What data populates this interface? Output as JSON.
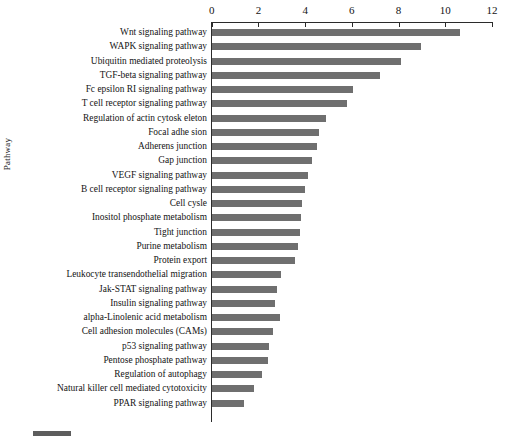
{
  "chart_data": {
    "type": "bar",
    "orientation": "horizontal",
    "title": "",
    "xlabel": "",
    "ylabel": "Pathway",
    "xlim": [
      0,
      12
    ],
    "xticks": [
      0,
      2,
      4,
      6,
      8,
      10,
      12
    ],
    "grid": false,
    "legend": "",
    "bar_color": "#6f6f6f",
    "categories": [
      "Wnt signaling pathway",
      "WAPK signaling pathway",
      "Ubiquitin mediated proteolysis",
      "TGF-beta signaling pathway",
      "Fc epsilon RI signaling pathway",
      "T cell receptor signaling pathway",
      "Regulation of actin cytosk eleton",
      "Focal adhe sion",
      "Adherens junction",
      "Gap junction",
      "VEGF signaling pathway",
      "B cell receptor signaling pathway",
      "Cell cysle",
      "Inositol phosphate metabolism",
      "Tight junction",
      "Purine metabolism",
      "Protein export",
      "Leukocyte transendothelial migration",
      "Jak-STAT signaling pathway",
      "Insulin signaling pathway",
      "alpha-Linolenic acid metabolism",
      "Cell adhesion molecules (CAMs)",
      "p53 signaling pathway",
      "Pentose phosphate pathway",
      "Regulation of autophagy",
      "Natural killer cell mediated cytotoxicity",
      "PPAR signaling pathway"
    ],
    "values": [
      10.6,
      8.95,
      8.1,
      7.2,
      6.05,
      5.8,
      4.9,
      4.6,
      4.5,
      4.3,
      4.1,
      4.0,
      3.85,
      3.8,
      3.75,
      3.7,
      3.55,
      2.95,
      2.8,
      2.7,
      2.9,
      2.6,
      2.45,
      2.4,
      2.15,
      1.8,
      1.35
    ]
  },
  "axis": {
    "y_title": "Pathway",
    "x_tick_labels": [
      "0",
      "2",
      "4",
      "6",
      "8",
      "10",
      "12"
    ]
  }
}
